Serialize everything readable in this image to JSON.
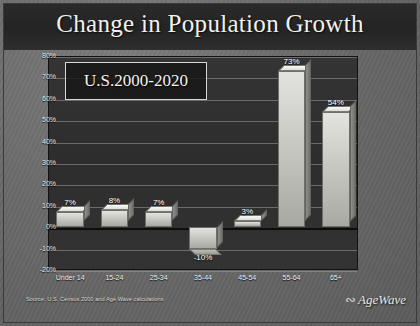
{
  "slide": {
    "title": "Change in Population Growth",
    "callout": "U.S.2000-2020",
    "source": "Source:  U.S. Census 2000 and Age Wave calculations",
    "logo_text": "AgeWave",
    "logo_mark": "swoosh-icon"
  },
  "colors": {
    "slide_bg": "#6a6a6a",
    "title_band": "#282828",
    "plot_bg": "#303030",
    "gridline": "#9a9a9a",
    "bar_face": "#cfcfca",
    "text": "#f2f0ec"
  },
  "chart_data": {
    "type": "bar",
    "title": "Change in Population Growth",
    "subtitle": "U.S.2000-2020",
    "xlabel": "",
    "ylabel": "",
    "categories": [
      "Under 14",
      "15-24",
      "25-34",
      "35-44",
      "45-54",
      "55-64",
      "65+"
    ],
    "values": [
      7,
      8,
      7,
      -10,
      3,
      73,
      54
    ],
    "data_labels": [
      "7%",
      "8%",
      "7%",
      "-10%",
      "3%",
      "73%",
      "54%"
    ],
    "ylim": [
      -20,
      80
    ],
    "ytick_step": 10,
    "ytick_labels": [
      "80%",
      "70%",
      "60%",
      "50%",
      "40%",
      "30%",
      "20%",
      "10%",
      "0%",
      "-10%",
      "-20%"
    ],
    "ytick_values": [
      80,
      70,
      60,
      50,
      40,
      30,
      20,
      10,
      0,
      -10,
      -20
    ],
    "grid": true,
    "legend": false,
    "zero_line": 0
  }
}
